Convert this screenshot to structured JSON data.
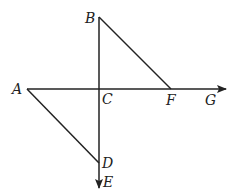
{
  "diagram": {
    "points": {
      "A": {
        "label": "A",
        "x": 27,
        "y": 89
      },
      "B": {
        "label": "B",
        "x": 99,
        "y": 17
      },
      "C": {
        "label": "C",
        "x": 99,
        "y": 89
      },
      "D": {
        "label": "D",
        "x": 99,
        "y": 163
      },
      "E": {
        "label": "E",
        "x": 99,
        "y": 188
      },
      "F": {
        "label": "F",
        "x": 171,
        "y": 89
      },
      "G": {
        "label": "G",
        "x": 226,
        "y": 89
      }
    },
    "segments": [
      {
        "from": "B",
        "to": "F"
      },
      {
        "from": "A",
        "to": "D"
      },
      {
        "from": "A",
        "to": "G",
        "arrow": true
      },
      {
        "from": "B",
        "to": "E",
        "arrow": true
      }
    ],
    "colors": {
      "stroke": "#222222",
      "background": "#ffffff"
    }
  }
}
